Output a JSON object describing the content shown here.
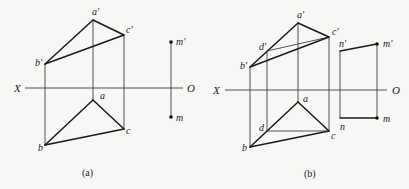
{
  "figure": {
    "background": "#f7f7f5",
    "line_color": "#1a1a1a",
    "panels": [
      {
        "id": "a",
        "caption": "(a)",
        "caption_pos": [
          82,
          176
        ],
        "axis": {
          "x1": 25,
          "x2": 183,
          "y": 88,
          "left_label": "X",
          "right_label": "O",
          "left_label_pos": [
            14,
            92
          ],
          "right_label_pos": [
            187,
            92
          ]
        },
        "points": {
          "a_prime": {
            "label": "a'",
            "xy": [
              93,
              20
            ],
            "label_pos": [
              92,
              15
            ]
          },
          "b_prime": {
            "label": "b'",
            "xy": [
              45,
              64
            ],
            "label_pos": [
              35,
              66
            ]
          },
          "c_prime": {
            "label": "c'",
            "xy": [
              124,
              35
            ],
            "label_pos": [
              126,
              33
            ]
          },
          "a": {
            "label": "a",
            "xy": [
              93,
              100
            ],
            "label_pos": [
              100,
              99
            ]
          },
          "b": {
            "label": "b",
            "xy": [
              45,
              145
            ],
            "label_pos": [
              38,
              151
            ]
          },
          "c": {
            "label": "c",
            "xy": [
              124,
              129
            ],
            "label_pos": [
              126,
              134
            ]
          },
          "m_prime": {
            "label": "m'",
            "xy": [
              171,
              42
            ],
            "label_pos": [
              176,
              45
            ]
          },
          "m": {
            "label": "m",
            "xy": [
              171,
              117
            ],
            "label_pos": [
              176,
              121
            ]
          }
        }
      },
      {
        "id": "b",
        "caption": "(b)",
        "caption_pos": [
          304,
          177
        ],
        "axis": {
          "x1": 225,
          "x2": 387,
          "y": 90,
          "left_label": "X",
          "right_label": "O",
          "left_label_pos": [
            213,
            94
          ],
          "right_label_pos": [
            392,
            94
          ]
        },
        "points": {
          "a_prime": {
            "label": "a'",
            "xy": [
              298,
              23
            ],
            "label_pos": [
              297,
              18
            ]
          },
          "b_prime": {
            "label": "b'",
            "xy": [
              250,
              67
            ],
            "label_pos": [
              240,
              69
            ]
          },
          "c_prime": {
            "label": "c'",
            "xy": [
              329,
              37
            ],
            "label_pos": [
              332,
              35
            ]
          },
          "d_prime": {
            "label": "d'",
            "xy": [
              267,
              51
            ],
            "label_pos": [
              259,
              50
            ]
          },
          "a": {
            "label": "a",
            "xy": [
              298,
              102
            ],
            "label_pos": [
              303,
              102
            ]
          },
          "b": {
            "label": "b",
            "xy": [
              250,
              147
            ],
            "label_pos": [
              242,
              151
            ]
          },
          "c": {
            "label": "c",
            "xy": [
              329,
              131
            ],
            "label_pos": [
              331,
              139
            ]
          },
          "d": {
            "label": "d",
            "xy": [
              267,
              131
            ],
            "label_pos": [
              259,
              131
            ]
          },
          "n_prime": {
            "label": "n'",
            "xy": [
              340,
              51
            ],
            "label_pos": [
              339,
              47
            ]
          },
          "m_prime": {
            "label": "m'",
            "xy": [
              377,
              44
            ],
            "label_pos": [
              383,
              47
            ]
          },
          "n": {
            "label": "n",
            "xy": [
              340,
              118
            ],
            "label_pos": [
              340,
              130
            ]
          },
          "m": {
            "label": "m",
            "xy": [
              377,
              118
            ],
            "label_pos": [
              383,
              122
            ]
          }
        }
      }
    ]
  }
}
